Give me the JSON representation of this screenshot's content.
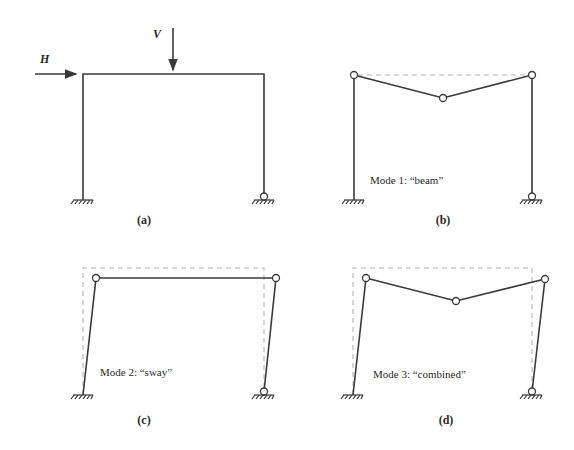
{
  "figure": {
    "panels": [
      {
        "id": "a",
        "caption": "(a)",
        "loads": {
          "horizontal": "H",
          "vertical": "V"
        }
      },
      {
        "id": "b",
        "caption": "(b)",
        "mode_label": "Mode 1: “beam”"
      },
      {
        "id": "c",
        "caption": "(c)",
        "mode_label": "Mode 2: “sway”"
      },
      {
        "id": "d",
        "caption": "(d)",
        "mode_label": "Mode 3: “combined”"
      }
    ],
    "colors": {
      "member": "#3a3a3a",
      "dashed_reference": "#b5b5b5"
    }
  }
}
